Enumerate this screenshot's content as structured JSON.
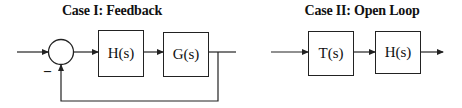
{
  "diagrams": [
    {
      "title": "Case I: Feedback",
      "type": "closed-loop block diagram",
      "summing_junction": {
        "feedback_sign": "–"
      },
      "blocks": [
        {
          "label": "H(s)"
        },
        {
          "label": "G(s)"
        }
      ],
      "connections": [
        "input -> summing junction (+)",
        "summing junction -> H(s)",
        "H(s) -> G(s)",
        "G(s) -> output",
        "output -> summing junction (–) feedback"
      ]
    },
    {
      "title": "Case II: Open Loop",
      "type": "open-loop block diagram",
      "blocks": [
        {
          "label": "T(s)"
        },
        {
          "label": "H(s)"
        }
      ],
      "connections": [
        "input -> T(s)",
        "T(s) -> H(s)",
        "H(s) -> output"
      ]
    }
  ],
  "colors": {
    "line": "#222222",
    "background": "#ffffff"
  }
}
